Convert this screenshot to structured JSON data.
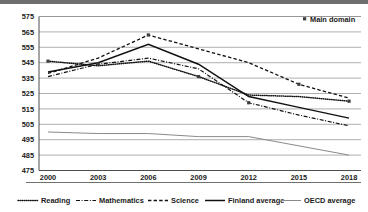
{
  "chart_data": {
    "type": "line",
    "title": "",
    "xlabel": "",
    "ylabel": "",
    "ylim": [
      475,
      575
    ],
    "ytick_step": 10,
    "yticks": [
      475,
      485,
      495,
      505,
      515,
      525,
      535,
      545,
      555,
      565,
      575
    ],
    "categories": [
      "2000",
      "2003",
      "2006",
      "2009",
      "2012",
      "2015",
      "2018"
    ],
    "x": [
      2000,
      2003,
      2006,
      2009,
      2012,
      2015,
      2018
    ],
    "grid": true,
    "legend_position": "bottom",
    "annotations": [
      {
        "name": "main-domain",
        "label": "Main domain",
        "marker": "square"
      }
    ],
    "series": [
      {
        "name": "Reading",
        "style": "dotted",
        "color": "#111111",
        "values": [
          546,
          543,
          546,
          536,
          524,
          523,
          520
        ],
        "main_domain_years": [
          2000,
          2009,
          2018
        ]
      },
      {
        "name": "Mathematics",
        "style": "dash-dot",
        "color": "#111111",
        "values": [
          536,
          544,
          548,
          541,
          519,
          511,
          504
        ],
        "main_domain_years": [
          2003,
          2012
        ]
      },
      {
        "name": "Science",
        "style": "dashed",
        "color": "#111111",
        "values": [
          538,
          548,
          563,
          554,
          545,
          531,
          522
        ],
        "main_domain_years": [
          2006,
          2015
        ]
      },
      {
        "name": "Finland average",
        "style": "solid",
        "color": "#111111",
        "values": [
          539,
          545,
          557,
          544,
          523,
          516,
          509
        ]
      },
      {
        "name": "OECD average",
        "style": "solid-grey",
        "color": "#8a8a8a",
        "values": [
          500,
          499,
          499,
          497,
          497,
          491,
          485
        ]
      }
    ]
  },
  "axes": {
    "y": {
      "labels": [
        "575",
        "565",
        "555",
        "545",
        "535",
        "525",
        "515",
        "505",
        "495",
        "485",
        "475"
      ]
    },
    "x": {
      "labels": [
        "2000",
        "2003",
        "2006",
        "2009",
        "2012",
        "2015",
        "2018"
      ]
    }
  },
  "annotation": {
    "main_domain_label": "Main domain"
  },
  "legend": {
    "items": [
      {
        "label": "Reading",
        "style": "dotted"
      },
      {
        "label": "Mathematics",
        "style": "dash-dot"
      },
      {
        "label": "Science",
        "style": "dashed"
      },
      {
        "label": "Finland average",
        "style": "solid"
      },
      {
        "label": "OECD average",
        "style": "solid-grey"
      }
    ]
  },
  "colors": {
    "ink": "#111111",
    "grid": "#8c8c8c",
    "oecd": "#8a8a8a",
    "topbar": "#6e6e6e"
  }
}
